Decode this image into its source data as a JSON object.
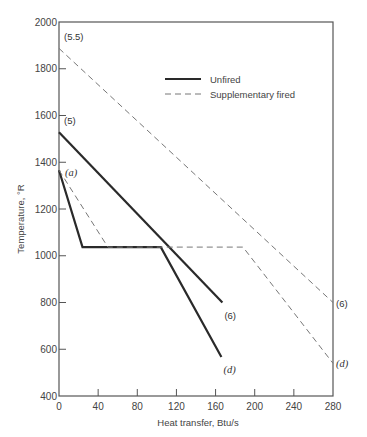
{
  "chart_data": {
    "type": "line",
    "title": "",
    "xlabel": "Heat transfer, Btu/s",
    "ylabel": "Temperature, °R",
    "xlim": [
      0,
      280
    ],
    "ylim": [
      400,
      2000
    ],
    "xticks": [
      0,
      40,
      80,
      120,
      160,
      200,
      240,
      280
    ],
    "yticks": [
      400,
      600,
      800,
      1000,
      1200,
      1400,
      1600,
      1800,
      2000
    ],
    "grid": false,
    "legend": {
      "placement": "top-center",
      "entries": [
        {
          "label": "Unfired",
          "style": "solid"
        },
        {
          "label": "Supplementary fired",
          "style": "dashed"
        }
      ]
    },
    "series": [
      {
        "name": "Unfired gas (5)-(6)",
        "group": "Unfired",
        "style": "solid",
        "points": [
          [
            0,
            1528
          ],
          [
            167,
            800
          ]
        ],
        "labels": [
          {
            "text": "(5)",
            "at": 0,
            "italic": false
          },
          {
            "text": "(6)",
            "at": 1,
            "italic": false
          }
        ]
      },
      {
        "name": "Unfired steam (a)-(d)",
        "group": "Unfired",
        "style": "solid",
        "points": [
          [
            0,
            1366
          ],
          [
            24,
            1037
          ],
          [
            104,
            1037
          ],
          [
            166,
            567
          ]
        ],
        "labels": [
          {
            "text": "(a)",
            "at": 0,
            "italic": true
          },
          {
            "text": "(d)",
            "at": 3,
            "italic": true
          }
        ]
      },
      {
        "name": "Supplementary fired gas (5.5)-(6)",
        "group": "Supplementary fired",
        "style": "dashed",
        "points": [
          [
            0,
            1887
          ],
          [
            280,
            800
          ]
        ],
        "labels": [
          {
            "text": "(5.5)",
            "at": 0,
            "italic": false
          },
          {
            "text": "(6)",
            "at": 1,
            "italic": false
          }
        ]
      },
      {
        "name": "Supplementary fired steam (a)-(d)",
        "group": "Supplementary fired",
        "style": "dashed",
        "points": [
          [
            0,
            1366
          ],
          [
            50,
            1037
          ],
          [
            188,
            1037
          ],
          [
            280,
            540
          ]
        ],
        "labels": [
          {
            "text": "(d)",
            "at": 3,
            "italic": true
          }
        ]
      }
    ]
  }
}
